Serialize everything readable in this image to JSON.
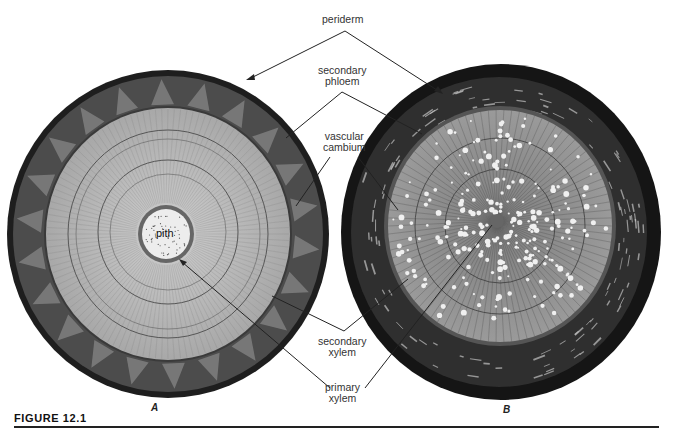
{
  "figure": {
    "caption": "FIGURE 12.1",
    "panels": [
      {
        "id": "A",
        "label": "A"
      },
      {
        "id": "B",
        "label": "B"
      }
    ],
    "labels": {
      "periderm": "periderm",
      "secondary_phloem": [
        "secondary",
        "phloem"
      ],
      "vascular_cambium": [
        "vascular",
        "cambium"
      ],
      "secondary_xylem": [
        "secondary",
        "xylem"
      ],
      "primary_xylem": [
        "primary",
        "xylem"
      ],
      "pith": "pith"
    },
    "colors": {
      "ink": "#222222",
      "bark": "#1a1a1a",
      "phloem_a": "#4a4a4a",
      "xylem_a_light": "#b5b5b5",
      "xylem_a_mid": "#9a9a9a",
      "pith": "#eeeeee",
      "xylem_b": "#8a8a8a",
      "vessel": "#f2f2f2"
    }
  }
}
